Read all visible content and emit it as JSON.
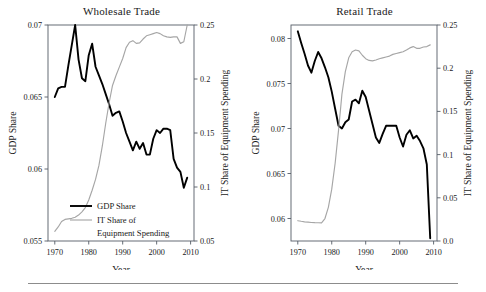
{
  "figure": {
    "background": "#ffffff",
    "series_colors": {
      "gdp_share": "#000000",
      "it_share": "#a6a6a6"
    },
    "footer_rule": true
  },
  "legend": {
    "position": "lower-left-of-left-panel",
    "items": [
      {
        "label": "GDP Share",
        "color": "#000000",
        "style": "thick-solid"
      },
      {
        "label": "IT Share of",
        "label2": "Equipment Spending",
        "color": "#a6a6a6",
        "style": "thin-solid"
      }
    ]
  },
  "chart_data": [
    {
      "type": "line",
      "panel": "left",
      "title": "Wholesale Trade",
      "xlabel": "Year",
      "ylabel": "GDP Share",
      "y2label": "IT Share of Equipment Spending",
      "grid": false,
      "xlim": [
        1968,
        2011
      ],
      "xticks": [
        1970,
        1980,
        1990,
        2000,
        2010
      ],
      "xticklabels": [
        "1970",
        "1980",
        "1990",
        "2000",
        "2010"
      ],
      "ylim": [
        0.055,
        0.07
      ],
      "yticks": [
        0.055,
        0.06,
        0.065,
        0.07
      ],
      "yticklabels": [
        "0.055",
        "0.06",
        "0.065",
        "0.07"
      ],
      "y2lim": [
        0.05,
        0.25
      ],
      "y2ticks": [
        0.05,
        0.1,
        0.15,
        0.2,
        0.25
      ],
      "y2ticklabels": [
        "0.05",
        "0.1",
        "0.15",
        "0.2",
        "0.25"
      ],
      "series": [
        {
          "name": "GDP Share",
          "axis": "left",
          "color": "#000000",
          "x": [
            1970,
            1971,
            1972,
            1973,
            1974,
            1975,
            1976,
            1977,
            1978,
            1979,
            1980,
            1981,
            1982,
            1983,
            1984,
            1985,
            1986,
            1987,
            1988,
            1989,
            1990,
            1991,
            1992,
            1993,
            1994,
            1995,
            1996,
            1997,
            1998,
            1999,
            2000,
            2001,
            2002,
            2003,
            2004,
            2005,
            2006,
            2007,
            2008,
            2009
          ],
          "y": [
            0.065,
            0.0656,
            0.0657,
            0.0657,
            0.0672,
            0.0686,
            0.07,
            0.0676,
            0.0663,
            0.0661,
            0.0679,
            0.0687,
            0.0671,
            0.0665,
            0.0659,
            0.0652,
            0.0645,
            0.0637,
            0.0639,
            0.064,
            0.0633,
            0.0625,
            0.0619,
            0.0613,
            0.0619,
            0.0614,
            0.0618,
            0.061,
            0.061,
            0.0621,
            0.0627,
            0.0625,
            0.0628,
            0.0628,
            0.0627,
            0.0607,
            0.0601,
            0.0598,
            0.0587,
            0.0594,
            0.0589,
            0.0592,
            0.0579,
            0.0565,
            0.0551
          ]
        },
        {
          "name": "IT Share of Equipment Spending",
          "axis": "right",
          "color": "#a6a6a6",
          "x": [
            1970,
            1971,
            1972,
            1973,
            1974,
            1975,
            1976,
            1977,
            1978,
            1979,
            1980,
            1981,
            1982,
            1983,
            1984,
            1985,
            1986,
            1987,
            1988,
            1989,
            1990,
            1991,
            1992,
            1993,
            1994,
            1995,
            1996,
            1997,
            1998,
            1999,
            2000,
            2001,
            2002,
            2003,
            2004,
            2005,
            2006,
            2007,
            2008,
            2009
          ],
          "y": [
            0.059,
            0.063,
            0.068,
            0.07,
            0.0705,
            0.071,
            0.072,
            0.074,
            0.077,
            0.081,
            0.088,
            0.097,
            0.107,
            0.12,
            0.138,
            0.159,
            0.178,
            0.194,
            0.203,
            0.211,
            0.219,
            0.229,
            0.234,
            0.2355,
            0.233,
            0.2335,
            0.237,
            0.24,
            0.241,
            0.242,
            0.243,
            0.242,
            0.24,
            0.239,
            0.2385,
            0.239,
            0.239,
            0.233,
            0.2345,
            0.25
          ]
        }
      ]
    },
    {
      "type": "line",
      "panel": "right",
      "title": "Retail Trade",
      "xlabel": "Year",
      "ylabel": "GDP Share",
      "y2label": "IT Share of Equipment Spending",
      "grid": false,
      "xlim": [
        1968,
        2011
      ],
      "xticks": [
        1970,
        1980,
        1990,
        2000,
        2010
      ],
      "xticklabels": [
        "1970",
        "1980",
        "1990",
        "2000",
        "2010"
      ],
      "ylim": [
        0.0575,
        0.0815
      ],
      "yticks": [
        0.06,
        0.065,
        0.07,
        0.075,
        0.08
      ],
      "yticklabels": [
        "0.06",
        "0.065",
        "0.07",
        "0.075",
        "0.08"
      ],
      "y2lim": [
        0.0,
        0.25
      ],
      "y2ticks": [
        0.0,
        0.05,
        0.1,
        0.15,
        0.2,
        0.25
      ],
      "y2ticklabels": [
        "0.0",
        "0.05",
        "0.1",
        "0.15",
        "0.2",
        "0.25"
      ],
      "series": [
        {
          "name": "GDP Share",
          "axis": "left",
          "color": "#000000",
          "x": [
            1970,
            1971,
            1972,
            1973,
            1974,
            1975,
            1976,
            1977,
            1978,
            1979,
            1980,
            1981,
            1982,
            1983,
            1984,
            1985,
            1986,
            1987,
            1988,
            1989,
            1990,
            1991,
            1992,
            1993,
            1994,
            1995,
            1996,
            1997,
            1998,
            1999,
            2000,
            2001,
            2002,
            2003,
            2004,
            2005,
            2006,
            2007,
            2008,
            2009
          ],
          "y": [
            0.0808,
            0.0795,
            0.0783,
            0.077,
            0.0762,
            0.0775,
            0.0785,
            0.0778,
            0.0768,
            0.0757,
            0.0741,
            0.0722,
            0.0703,
            0.07,
            0.0707,
            0.071,
            0.073,
            0.0732,
            0.0728,
            0.0742,
            0.0735,
            0.072,
            0.0705,
            0.069,
            0.0684,
            0.0694,
            0.0703,
            0.0703,
            0.0703,
            0.0703,
            0.069,
            0.068,
            0.0693,
            0.0698,
            0.0689,
            0.0692,
            0.0686,
            0.0678,
            0.066,
            0.0578
          ]
        },
        {
          "name": "IT Share of Equipment Spending",
          "axis": "right",
          "color": "#a6a6a6",
          "x": [
            1970,
            1971,
            1972,
            1973,
            1974,
            1975,
            1976,
            1977,
            1978,
            1979,
            1980,
            1981,
            1982,
            1983,
            1984,
            1985,
            1986,
            1987,
            1988,
            1989,
            1990,
            1991,
            1992,
            1993,
            1994,
            1995,
            1996,
            1997,
            1998,
            1999,
            2000,
            2001,
            2002,
            2003,
            2004,
            2005,
            2006,
            2007,
            2008,
            2009
          ],
          "y": [
            0.0235,
            0.0228,
            0.0222,
            0.0218,
            0.0214,
            0.0212,
            0.0211,
            0.021,
            0.026,
            0.039,
            0.06,
            0.09,
            0.128,
            0.17,
            0.196,
            0.212,
            0.219,
            0.221,
            0.22,
            0.215,
            0.211,
            0.209,
            0.2085,
            0.2095,
            0.211,
            0.212,
            0.213,
            0.214,
            0.216,
            0.217,
            0.218,
            0.219,
            0.221,
            0.2235,
            0.225,
            0.223,
            0.223,
            0.2245,
            0.225,
            0.227
          ]
        }
      ]
    }
  ]
}
